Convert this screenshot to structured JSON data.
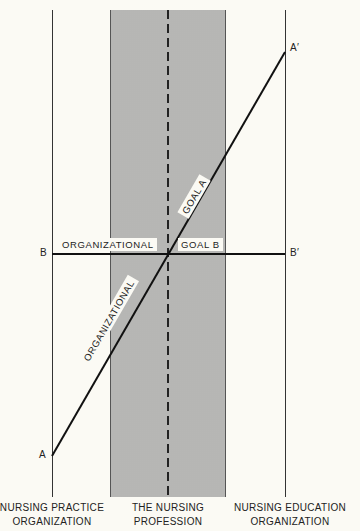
{
  "diagram": {
    "points": {
      "a": "A",
      "a_prime": "A′",
      "b": "B",
      "b_prime": "B′"
    },
    "line_labels": {
      "horizontal_left": "ORGANIZATIONAL",
      "horizontal_right": "GOAL B",
      "diagonal_lower": "ORGANIZATIONAL",
      "diagonal_upper": "GOAL A"
    },
    "columns": [
      {
        "line1": "NURSING PRACTICE",
        "line2": "ORGANIZATION"
      },
      {
        "line1": "THE NURSING",
        "line2": "PROFESSION"
      },
      {
        "line1": "NURSING EDUCATION",
        "line2": "ORGANIZATION"
      }
    ],
    "colors": {
      "background": "#fbfaf4",
      "band": "#c2c2c0",
      "line": "#111111"
    }
  }
}
